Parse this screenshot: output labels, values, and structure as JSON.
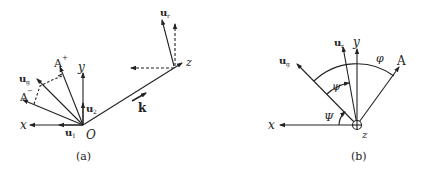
{
  "figure": {
    "panel_a": {
      "caption": "(a)",
      "labels": {
        "x": "x",
        "y": "y",
        "z": "z",
        "origin": "O",
        "u1": "u",
        "u1_sub": "1",
        "u2": "u",
        "u2_sub": "2",
        "ur": "u",
        "ur_sub": "r",
        "ug": "u",
        "ug_sub": "g",
        "a_plus": "A",
        "a_plus_sup": "+",
        "a_minus": "A",
        "a_minus_sup": "−",
        "k": "k"
      }
    },
    "panel_b": {
      "caption": "(b)",
      "labels": {
        "x": "x",
        "y": "y",
        "z": "z",
        "ur": "u",
        "ur_sub": "r",
        "ug": "u",
        "ug_sub": "g",
        "a": "A",
        "psi_small": "ψ",
        "phi": "φ",
        "psi_big": "Ψ"
      }
    },
    "colors": {
      "stroke": "#222222",
      "background": "#ffffff"
    }
  }
}
